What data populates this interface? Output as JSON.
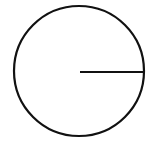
{
  "diagram": {
    "type": "circle-with-radius",
    "background": "#ffffff",
    "stroke_color": "#111111",
    "stroke_width": 2.2,
    "circle": {
      "cx": 79,
      "cy": 71,
      "r": 65
    },
    "radius_line": {
      "x1": 80,
      "y1": 72,
      "x2": 144,
      "y2": 72
    },
    "labels": []
  }
}
